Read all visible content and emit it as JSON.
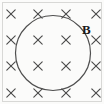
{
  "figure": {
    "background_color": "#fbfbfa",
    "ink_color": "#4a4a4a",
    "label_color": "#1a1a1a",
    "width": 104,
    "height": 104
  },
  "border": {
    "name": "figure-border",
    "color": "#d8d8d6",
    "stroke_width": 1,
    "x": 2.5,
    "y": 2.5,
    "width": 99,
    "height": 99
  },
  "loop": {
    "name": "circular-loop",
    "shape": "circle",
    "center_x": 53,
    "center_y": 53,
    "radius": 37.5,
    "stroke_color": "#4f4f4f",
    "stroke_width": 1.2,
    "fill": "none"
  },
  "label": {
    "text": "B",
    "meaning": "magnetic-field-vector",
    "x": 82,
    "y": 23,
    "font_size": 13,
    "bold": true
  },
  "field_symbol": {
    "glyph": "x",
    "meaning": "field-into-page",
    "color": "#4a4a4a",
    "arm_length": 4.2,
    "stroke_width": 1.1
  },
  "field_grid": {
    "rows": 4,
    "cols": 4,
    "x_positions": [
      11,
      38,
      66,
      96
    ],
    "y_positions": [
      14,
      40,
      66,
      93
    ],
    "marks": [
      {
        "id": "x-r1c1",
        "x": 11,
        "y": 14,
        "inside_loop": false
      },
      {
        "id": "x-r1c2",
        "x": 38,
        "y": 14,
        "inside_loop": false
      },
      {
        "id": "x-r1c3",
        "x": 66,
        "y": 14,
        "inside_loop": false
      },
      {
        "id": "x-r1c4",
        "x": 96,
        "y": 14,
        "inside_loop": false
      },
      {
        "id": "x-r2c1",
        "x": 11,
        "y": 40,
        "inside_loop": false
      },
      {
        "id": "x-r2c2",
        "x": 38,
        "y": 40,
        "inside_loop": true
      },
      {
        "id": "x-r2c3",
        "x": 66,
        "y": 40,
        "inside_loop": true
      },
      {
        "id": "x-r2c4",
        "x": 96,
        "y": 40,
        "inside_loop": false
      },
      {
        "id": "x-r3c1",
        "x": 11,
        "y": 66,
        "inside_loop": false
      },
      {
        "id": "x-r3c2",
        "x": 38,
        "y": 66,
        "inside_loop": true
      },
      {
        "id": "x-r3c3",
        "x": 66,
        "y": 66,
        "inside_loop": true
      },
      {
        "id": "x-r3c4",
        "x": 96,
        "y": 66,
        "inside_loop": false
      },
      {
        "id": "x-r4c1",
        "x": 11,
        "y": 93,
        "inside_loop": false
      },
      {
        "id": "x-r4c2",
        "x": 38,
        "y": 93,
        "inside_loop": false
      },
      {
        "id": "x-r4c3",
        "x": 66,
        "y": 93,
        "inside_loop": false
      },
      {
        "id": "x-r4c4",
        "x": 96,
        "y": 93,
        "inside_loop": false
      }
    ]
  }
}
